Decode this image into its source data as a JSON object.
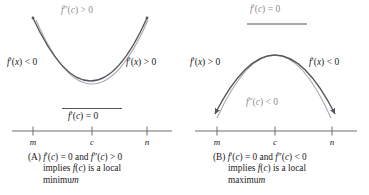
{
  "figure": {
    "type": "calculus-second-derivative-test-diagram",
    "panels": [
      {
        "id": "A",
        "curve_shape": "upward-parabola",
        "labels": {
          "concavity": "f″(c) > 0",
          "left_slope": "f′(x) < 0",
          "right_slope": "f′(x) > 0",
          "tangent": "f′(c) = 0"
        },
        "axis": {
          "ticks": [
            "m",
            "c",
            "n"
          ]
        },
        "caption": {
          "line1": "(A)  f′(c) = 0 and f″(c) > 0",
          "line2": "implies f(c) is a local",
          "line3": "minimum"
        }
      },
      {
        "id": "B",
        "curve_shape": "downward-parabola",
        "labels": {
          "concavity": "f″(c) < 0",
          "left_slope": "f′(x) > 0",
          "right_slope": "f′(x) < 0",
          "tangent": "f′(c) = 0"
        },
        "axis": {
          "ticks": [
            "m",
            "c",
            "n"
          ]
        },
        "caption": {
          "line1": "(B)  f′(c) = 0 and f″(c) < 0",
          "line2": "implies f(c) is a local",
          "line3": "maximum"
        }
      }
    ],
    "colors": {
      "curve": "#4a4a52",
      "curve_secondary": "#9a9aa0",
      "axis": "#6e6e74",
      "text": "#1a1a1a",
      "text_gray": "#8c8c90",
      "background": "#ffffff"
    }
  }
}
